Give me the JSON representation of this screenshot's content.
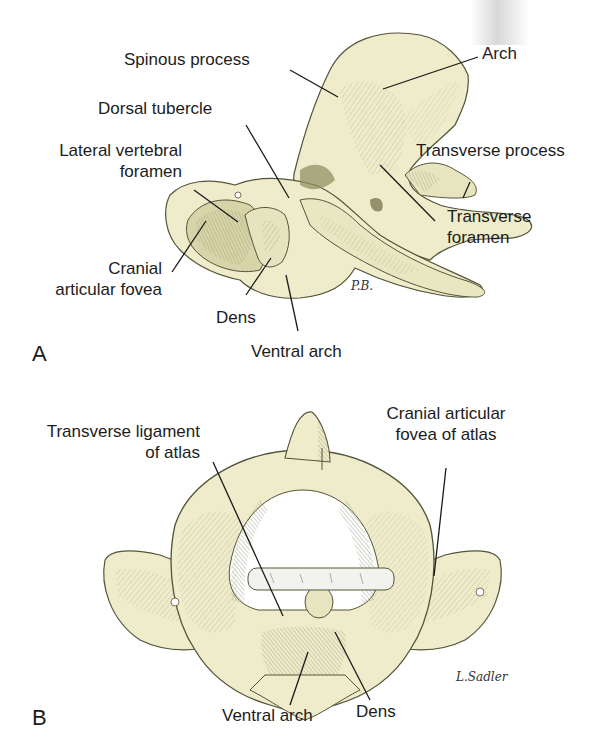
{
  "figure_a": {
    "panel_letter": "A",
    "signature": "P.B.",
    "labels": {
      "spinous_process": "Spinous process",
      "arch": "Arch",
      "dorsal_tubercle": "Dorsal tubercle",
      "lateral_vertebral_foramen_1": "Lateral vertebral",
      "lateral_vertebral_foramen_2": "foramen",
      "transverse_process": "Transverse process",
      "transverse_foramen_1": "Transverse",
      "transverse_foramen_2": "foramen",
      "cranial_articular_fovea_1": "Cranial",
      "cranial_articular_fovea_2": "articular fovea",
      "dens": "Dens",
      "ventral_arch": "Ventral arch"
    }
  },
  "figure_b": {
    "panel_letter": "B",
    "signature": "L.Sadler",
    "labels": {
      "transverse_ligament_1": "Transverse ligament",
      "transverse_ligament_2": "of atlas",
      "cranial_articular_fovea_atlas_1": "Cranial articular",
      "cranial_articular_fovea_atlas_2": "fovea of atlas",
      "ventral_arch": "Ventral arch",
      "dens": "Dens"
    }
  },
  "colors": {
    "bone_fill": "#eeeccb",
    "bone_shade": "#b7b58a",
    "bone_dark": "#6f6e48",
    "ligament": "#f2f2ee",
    "leader_line": "#1a1a1a"
  }
}
